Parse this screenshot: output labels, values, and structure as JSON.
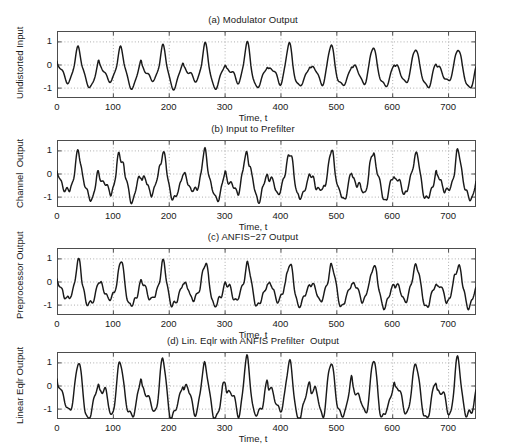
{
  "figure": {
    "kind": "multi-panel-time-series",
    "width": 506,
    "height": 448,
    "background": "#ffffff",
    "line_color": "#1a1a1a",
    "axis_color": "#4d4d4d",
    "grid_color": "#9a9a9a",
    "xlabel": "Time, t"
  },
  "chart_data": [
    {
      "type": "line",
      "panel": "a",
      "title": "(a) Modulator Output",
      "xlabel": "Time, t",
      "ylabel": "Undistorted Input",
      "xlim": [
        0,
        750
      ],
      "ylim": [
        -1.45,
        1.45
      ],
      "xticks": [
        0,
        100,
        200,
        300,
        400,
        500,
        600,
        700
      ],
      "yticks": [
        -1,
        0,
        1
      ],
      "grid": true,
      "grid_style": "dotted",
      "legend": null,
      "series": [
        {
          "name": "Undistorted Input",
          "synth": {
            "model": "pulse-train",
            "n": 751,
            "pulse_period": 75.5,
            "pulse_phase": 38,
            "noise": 0.0,
            "peak": 1.0,
            "trough": -0.78,
            "ripple_amp": 0.2,
            "ripple_freq": 0.26,
            "decay": 11.0,
            "seed": 11
          }
        }
      ]
    },
    {
      "type": "line",
      "panel": "b",
      "title": "(b) Input to Prefilter",
      "xlabel": "Time, t",
      "ylabel": "Channel  Output",
      "xlim": [
        0,
        750
      ],
      "ylim": [
        -1.45,
        1.45
      ],
      "xticks": [
        0,
        100,
        200,
        300,
        400,
        500,
        600,
        700
      ],
      "yticks": [
        -1,
        0,
        1
      ],
      "grid": true,
      "grid_style": "dotted",
      "legend": null,
      "series": [
        {
          "name": "Channel Output",
          "synth": {
            "model": "pulse-train",
            "n": 751,
            "pulse_period": 75.5,
            "pulse_phase": 38,
            "noise": 0.115,
            "peak": 1.12,
            "trough": -0.92,
            "ripple_amp": 0.3,
            "ripple_freq": 0.36,
            "decay": 13.0,
            "seed": 23
          }
        }
      ]
    },
    {
      "type": "line",
      "panel": "c",
      "title": "(c) ANFIS−27 Output",
      "xlabel": "Time, t",
      "ylabel": "Preprocessor Output",
      "xlim": [
        0,
        750
      ],
      "ylim": [
        -1.45,
        1.45
      ],
      "xticks": [
        0,
        100,
        200,
        300,
        400,
        500,
        600,
        700
      ],
      "yticks": [
        -1,
        0,
        1
      ],
      "grid": true,
      "grid_style": "dotted",
      "legend": null,
      "series": [
        {
          "name": "Preprocessor Output",
          "synth": {
            "model": "pulse-train",
            "n": 751,
            "pulse_period": 75.5,
            "pulse_phase": 38,
            "noise": 0.095,
            "peak": 1.0,
            "trough": -0.86,
            "ripple_amp": 0.27,
            "ripple_freq": 0.33,
            "decay": 12.0,
            "seed": 37
          }
        }
      ]
    },
    {
      "type": "line",
      "panel": "d",
      "title": "(d) Lin. Eqlr with ANFIS Prefilter  Output",
      "xlabel": "Time, t",
      "ylabel": "Linear Eqlr Output",
      "xlim": [
        0,
        750
      ],
      "ylim": [
        -1.45,
        1.45
      ],
      "xticks": [
        0,
        100,
        200,
        300,
        400,
        500,
        600,
        700
      ],
      "yticks": [
        -1,
        0,
        1
      ],
      "grid": true,
      "grid_style": "dotted",
      "legend": null,
      "series": [
        {
          "name": "Linear Eqlr Output",
          "synth": {
            "model": "pulse-train",
            "n": 751,
            "pulse_period": 75.5,
            "pulse_phase": 38,
            "noise": 0.055,
            "peak": 1.33,
            "trough": -1.1,
            "ripple_amp": 0.24,
            "ripple_freq": 0.3,
            "decay": 10.0,
            "seed": 53
          }
        }
      ]
    }
  ],
  "panel_geometry": [
    {
      "title_y": 14,
      "plot_x": 57,
      "plot_y": 31,
      "plot_w": 419,
      "plot_h": 67,
      "xlabel_y": 112,
      "ylabel_x": 14,
      "ylabel_y": 99
    },
    {
      "title_y": 123,
      "plot_x": 57,
      "plot_y": 140,
      "plot_w": 419,
      "plot_h": 67,
      "xlabel_y": 221,
      "ylabel_x": 14,
      "ylabel_y": 208
    },
    {
      "title_y": 231,
      "plot_x": 57,
      "plot_y": 248,
      "plot_w": 419,
      "plot_h": 67,
      "xlabel_y": 329,
      "ylabel_x": 14,
      "ylabel_y": 319
    },
    {
      "title_y": 335,
      "plot_x": 57,
      "plot_y": 352,
      "plot_w": 419,
      "plot_h": 67,
      "xlabel_y": 433,
      "ylabel_x": 14,
      "ylabel_y": 424
    }
  ]
}
